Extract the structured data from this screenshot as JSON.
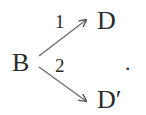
{
  "diagram": {
    "type": "branching-reaction",
    "source": {
      "label": "B"
    },
    "targets": [
      {
        "label": "D",
        "path_label": "1"
      },
      {
        "label": "D′",
        "path_label": "2"
      }
    ],
    "trailing_punctuation": "."
  }
}
